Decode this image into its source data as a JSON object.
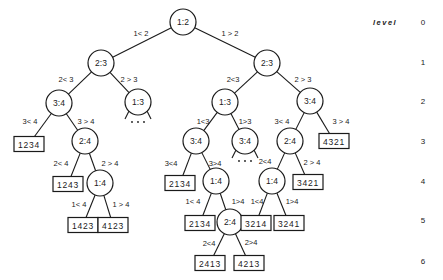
{
  "diagram": {
    "type": "decision-tree",
    "level_axis": {
      "title": "level",
      "levels": [
        {
          "label": "0",
          "y": 22
        },
        {
          "label": "1",
          "y": 62
        },
        {
          "label": "2",
          "y": 101
        },
        {
          "label": "3",
          "y": 141
        },
        {
          "label": "4",
          "y": 181
        },
        {
          "label": "5",
          "y": 220
        },
        {
          "label": "6",
          "y": 261
        }
      ]
    },
    "nodes": [
      {
        "id": "n0",
        "label": "1:2",
        "x": 183,
        "y": 22
      },
      {
        "id": "n1",
        "label": "2:3",
        "x": 101,
        "y": 63
      },
      {
        "id": "n2",
        "label": "2:3",
        "x": 267,
        "y": 63
      },
      {
        "id": "n3",
        "label": "3:4",
        "x": 59,
        "y": 103
      },
      {
        "id": "n4",
        "label": "1:3",
        "x": 138,
        "y": 102
      },
      {
        "id": "n5",
        "label": "1:3",
        "x": 225,
        "y": 102
      },
      {
        "id": "n6",
        "label": "3:4",
        "x": 310,
        "y": 101
      },
      {
        "id": "n7",
        "label": "2:4",
        "x": 85,
        "y": 141
      },
      {
        "id": "n8",
        "label": "3:4",
        "x": 196,
        "y": 141
      },
      {
        "id": "n9",
        "label": "3:4",
        "x": 245,
        "y": 141
      },
      {
        "id": "n10",
        "label": "2:4",
        "x": 290,
        "y": 141
      },
      {
        "id": "n11",
        "label": "1:4",
        "x": 100,
        "y": 183
      },
      {
        "id": "n12",
        "label": "1:4",
        "x": 216,
        "y": 181
      },
      {
        "id": "n13",
        "label": "1:4",
        "x": 272,
        "y": 181
      },
      {
        "id": "n14",
        "label": "2:4",
        "x": 230,
        "y": 222
      }
    ],
    "leaves": [
      {
        "id": "l0",
        "label": "1234",
        "x": 29,
        "y": 144
      },
      {
        "id": "l1",
        "label": "1243",
        "x": 68,
        "y": 184
      },
      {
        "id": "l2",
        "label": "1423",
        "x": 83,
        "y": 225
      },
      {
        "id": "l3",
        "label": "4123",
        "x": 113,
        "y": 225
      },
      {
        "id": "l4",
        "label": "2134",
        "x": 180,
        "y": 183
      },
      {
        "id": "l5",
        "label": "2134",
        "x": 200,
        "y": 223
      },
      {
        "id": "l6",
        "label": "3214",
        "x": 256,
        "y": 223
      },
      {
        "id": "l7",
        "label": "3241",
        "x": 289,
        "y": 223
      },
      {
        "id": "l8",
        "label": "3421",
        "x": 308,
        "y": 182
      },
      {
        "id": "l9",
        "label": "4321",
        "x": 334,
        "y": 141
      },
      {
        "id": "l10",
        "label": "2413",
        "x": 210,
        "y": 263
      },
      {
        "id": "l11",
        "label": "4213",
        "x": 249,
        "y": 263
      }
    ],
    "edges": [
      {
        "from": "n0",
        "to": "n1",
        "label": "1< 2",
        "lx": 141,
        "ly": 33
      },
      {
        "from": "n0",
        "to": "n2",
        "label": "1 > 2",
        "lx": 230,
        "ly": 33
      },
      {
        "from": "n1",
        "to": "n3",
        "label": "2< 3",
        "lx": 66,
        "ly": 79
      },
      {
        "from": "n1",
        "to": "n4",
        "label": "2 > 3",
        "lx": 129,
        "ly": 79
      },
      {
        "from": "n2",
        "to": "n5",
        "label": "2<3",
        "lx": 233,
        "ly": 79
      },
      {
        "from": "n2",
        "to": "n6",
        "label": "2 > 3",
        "lx": 303,
        "ly": 79
      },
      {
        "from": "n3",
        "to": "l0",
        "label": "3< 4",
        "lx": 30,
        "ly": 121
      },
      {
        "from": "n3",
        "to": "n7",
        "label": "3 > 4",
        "lx": 86,
        "ly": 121
      },
      {
        "from": "n5",
        "to": "n8",
        "label": "1<3",
        "lx": 203,
        "ly": 121
      },
      {
        "from": "n5",
        "to": "n9",
        "label": "1>3",
        "lx": 245,
        "ly": 121
      },
      {
        "from": "n6",
        "to": "n10",
        "label": "3< 4",
        "lx": 282,
        "ly": 121
      },
      {
        "from": "n6",
        "to": "l9",
        "label": "3 > 4",
        "lx": 341,
        "ly": 121
      },
      {
        "from": "n7",
        "to": "l1",
        "label": "2< 4",
        "lx": 61,
        "ly": 163
      },
      {
        "from": "n7",
        "to": "n11",
        "label": "2 > 4",
        "lx": 110,
        "ly": 163
      },
      {
        "from": "n8",
        "to": "l4",
        "label": "3<4",
        "lx": 171,
        "ly": 163
      },
      {
        "from": "n8",
        "to": "n12",
        "label": "3>4",
        "lx": 215,
        "ly": 163
      },
      {
        "from": "n10",
        "to": "n13",
        "label": "2<4",
        "lx": 265,
        "ly": 161
      },
      {
        "from": "n10",
        "to": "l8",
        "label": "2 > 4",
        "lx": 312,
        "ly": 162
      },
      {
        "from": "n11",
        "to": "l2",
        "label": "1< 4",
        "lx": 79,
        "ly": 204
      },
      {
        "from": "n11",
        "to": "l3",
        "label": "1 > 4",
        "lx": 121,
        "ly": 204
      },
      {
        "from": "n12",
        "to": "l5",
        "label": "1< 4",
        "lx": 193,
        "ly": 201
      },
      {
        "from": "n12",
        "to": "n14",
        "label": "1>4",
        "lx": 238,
        "ly": 201
      },
      {
        "from": "n13",
        "to": "l6",
        "label": "1<4",
        "lx": 257,
        "ly": 201
      },
      {
        "from": "n13",
        "to": "l7",
        "label": "1>4",
        "lx": 292,
        "ly": 201
      },
      {
        "from": "n14",
        "to": "l10",
        "label": "2<4",
        "lx": 209,
        "ly": 243
      },
      {
        "from": "n14",
        "to": "l11",
        "label": "2>4",
        "lx": 251,
        "ly": 242
      }
    ],
    "elided_subtrees": [
      {
        "under": "n4",
        "symbol": "…"
      },
      {
        "under": "n9",
        "symbol": "…"
      }
    ]
  }
}
